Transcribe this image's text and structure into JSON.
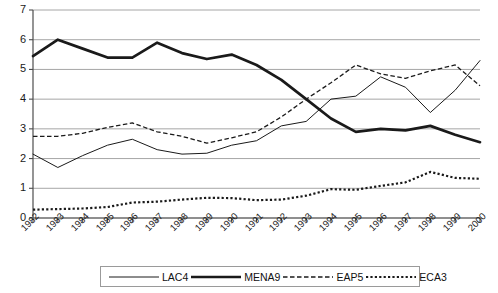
{
  "chart_data": {
    "type": "line",
    "title": "",
    "xlabel": "",
    "ylabel": "",
    "grid": true,
    "legend_position": "bottom",
    "xlim": [
      1982,
      2000
    ],
    "ylim": [
      0,
      7
    ],
    "yticks": [
      "0",
      "1",
      "2",
      "3",
      "4",
      "5",
      "6",
      "7"
    ],
    "categories": [
      "1982",
      "1983",
      "1984",
      "1985",
      "1986",
      "1987",
      "1988",
      "1989",
      "1990",
      "1991",
      "1992",
      "1993",
      "1994",
      "1995",
      "1996",
      "1997",
      "1998",
      "1999",
      "2000"
    ],
    "series": [
      {
        "name": "LAC4",
        "style": "thin-solid",
        "color": "#1a1a1a",
        "values": [
          2.15,
          1.7,
          2.1,
          2.45,
          2.65,
          2.3,
          2.15,
          2.18,
          2.45,
          2.6,
          3.1,
          3.25,
          4.0,
          4.1,
          4.75,
          4.4,
          3.55,
          4.3,
          5.3
        ]
      },
      {
        "name": "MENA9",
        "style": "thick-solid",
        "color": "#1a1a1a",
        "values": [
          5.45,
          6.0,
          5.7,
          5.4,
          5.4,
          5.9,
          5.55,
          5.35,
          5.5,
          5.15,
          4.65,
          4.0,
          3.35,
          2.9,
          3.0,
          2.95,
          3.1,
          2.8,
          2.55
        ]
      },
      {
        "name": "EAP5",
        "style": "dashed",
        "color": "#1a1a1a",
        "values": [
          2.75,
          2.75,
          2.85,
          3.05,
          3.2,
          2.9,
          2.75,
          2.52,
          2.7,
          2.9,
          3.4,
          4.0,
          4.55,
          5.15,
          4.85,
          4.7,
          4.95,
          5.15,
          4.45
        ]
      },
      {
        "name": "ECA3",
        "style": "dotted",
        "color": "#1a1a1a",
        "values": [
          0.28,
          0.3,
          0.32,
          0.37,
          0.52,
          0.55,
          0.62,
          0.68,
          0.67,
          0.6,
          0.62,
          0.75,
          0.97,
          0.95,
          1.08,
          1.2,
          1.55,
          1.35,
          1.32
        ]
      }
    ]
  },
  "legend": {
    "items": [
      {
        "label": "LAC4"
      },
      {
        "label": "MENA9"
      },
      {
        "label": "EAP5"
      },
      {
        "label": "ECA3"
      }
    ]
  }
}
